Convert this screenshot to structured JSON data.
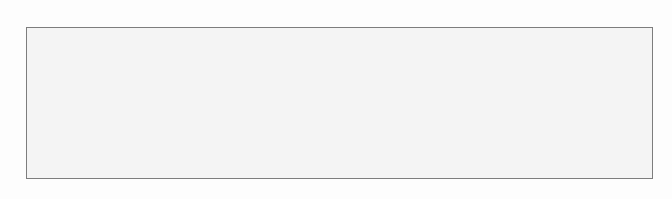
{
  "document": {
    "kind": "ecg-rhythm-strip",
    "title": "Electrocardiogram Rhythm Strip",
    "page_width": 672,
    "page_height": 199,
    "page_background": "#fdfdfd"
  },
  "grid": {
    "label": "ECG graph paper grid",
    "left": 26,
    "top": 27,
    "right": 652,
    "bottom": 178,
    "width": 626,
    "height": 151,
    "small_cell_px": 3.02,
    "large_cell_px": 15.1,
    "cells_per_large": 5,
    "paper_color": "#f4f4f4",
    "minor_line_color": "#b9b9b9",
    "major_line_color": "#8a8a8a",
    "border_color": "#7d7d7d",
    "minor_line_width": 0.6,
    "major_line_width": 1.0,
    "time_per_small_cell_s": 0.04,
    "time_per_large_cell_s": 0.2,
    "mv_per_large_cell": 0.5,
    "paper_speed_mm_per_s": 25,
    "gain_mm_per_mv": 10
  },
  "trace": {
    "label": "ECG waveform trace",
    "color": "#2b2b2b",
    "line_width": 2.0,
    "baseline_y": 124,
    "clip_top_y": 28,
    "beat_count": 19,
    "lead_name": "",
    "morphology": "tall clipped R waves with deep S waves and rounded T waves"
  },
  "ruler": {
    "label": "time calibration tick marks below grid",
    "axis_y": 178,
    "color": "#9a9a9a",
    "minor_tick_length": 4,
    "major_tick_length": 14,
    "minor_tick_spacing": 15.1,
    "major_tick_positions": [
      63,
      150,
      268,
      392,
      512,
      634
    ],
    "edge_tick_positions": [
      26,
      652
    ]
  },
  "chart_data": {
    "type": "line",
    "subtitle": "",
    "xlabel": "Time (s)",
    "ylabel": "Amplitude (mV)",
    "grid": true,
    "legend": "none",
    "xlim": [
      0,
      8.3
    ],
    "ylim": [
      -1.0,
      2.0
    ],
    "series": [
      {
        "name": "ECG lead",
        "description": "Sinus rhythm, tall clipped R waves, deep S waves, rounded T waves",
        "beats": [
          {
            "index": 1,
            "r_x": 36,
            "r_top": 28,
            "s_x": 44,
            "s_y": 140,
            "t_x": 60,
            "t_y": 104,
            "t_end_x": 72,
            "beat_end_x": 80
          },
          {
            "index": 2,
            "r_x": 83,
            "r_top": 28,
            "s_x": 90,
            "s_y": 136,
            "t_x": 105,
            "t_y": 105,
            "t_end_x": 117,
            "beat_end_x": 124
          },
          {
            "index": 3,
            "r_x": 126,
            "r_top": 28,
            "s_x": 133,
            "s_y": 136,
            "t_x": 146,
            "t_y": 103,
            "t_end_x": 158,
            "beat_end_x": 165
          },
          {
            "index": 4,
            "r_x": 168,
            "r_top": 28,
            "s_x": 175,
            "s_y": 138,
            "t_x": 189,
            "t_y": 100,
            "t_end_x": 202,
            "beat_end_x": 212
          },
          {
            "index": 5,
            "r_x": 214,
            "r_top": 28,
            "s_x": 221,
            "s_y": 144,
            "t_x": 237,
            "t_y": 100,
            "t_end_x": 250,
            "beat_end_x": 258
          },
          {
            "index": 6,
            "r_x": 261,
            "r_top": 28,
            "s_x": 268,
            "s_y": 139,
            "t_x": 281,
            "t_y": 106,
            "t_end_x": 293,
            "beat_end_x": 300
          },
          {
            "index": 7,
            "r_x": 303,
            "r_top": 28,
            "s_x": 310,
            "s_y": 141,
            "t_x": 324,
            "t_y": 103,
            "t_end_x": 337,
            "beat_end_x": 347
          },
          {
            "index": 8,
            "r_x": 349,
            "r_top": 28,
            "s_x": 356,
            "s_y": 138,
            "t_x": 369,
            "t_y": 106,
            "t_end_x": 381,
            "beat_end_x": 388
          },
          {
            "index": 9,
            "r_x": 391,
            "r_top": 28,
            "s_x": 398,
            "s_y": 146,
            "t_x": 413,
            "t_y": 105,
            "t_end_x": 424,
            "beat_end_x": 430
          },
          {
            "index": 10,
            "r_x": 433,
            "r_top": 28,
            "s_x": 440,
            "s_y": 147,
            "t_x": 455,
            "t_y": 102,
            "t_end_x": 466,
            "beat_end_x": 472
          },
          {
            "index": 11,
            "r_x": 475,
            "r_top": 28,
            "s_x": 482,
            "s_y": 148,
            "t_x": 497,
            "t_y": 101,
            "t_end_x": 508,
            "beat_end_x": 514
          },
          {
            "index": 12,
            "r_x": 517,
            "r_top": 28,
            "s_x": 524,
            "s_y": 143,
            "t_x": 537,
            "t_y": 102,
            "t_end_x": 548,
            "beat_end_x": 555
          },
          {
            "index": 13,
            "r_x": 558,
            "r_top": 28,
            "s_x": 565,
            "s_y": 140,
            "t_x": 578,
            "t_y": 106,
            "t_end_x": 590,
            "beat_end_x": 598
          },
          {
            "index": 14,
            "r_x": 601,
            "r_top": 28,
            "s_x": 608,
            "s_y": 142,
            "t_x": 622,
            "t_y": 104,
            "t_end_x": 634,
            "beat_end_x": 641
          },
          {
            "index": 15,
            "r_x": 644,
            "r_top": 28,
            "s_x": 650,
            "s_y": 138,
            "t_x": 660,
            "t_y": 108,
            "t_end_x": 668,
            "beat_end_x": 672
          }
        ],
        "r_spike_x_positions": [
          36,
          83,
          126,
          168,
          214,
          261,
          303,
          349,
          391,
          433,
          475,
          517,
          558,
          601,
          644
        ],
        "notes": "R spikes are clipped flat at the top border of the grid"
      }
    ]
  }
}
